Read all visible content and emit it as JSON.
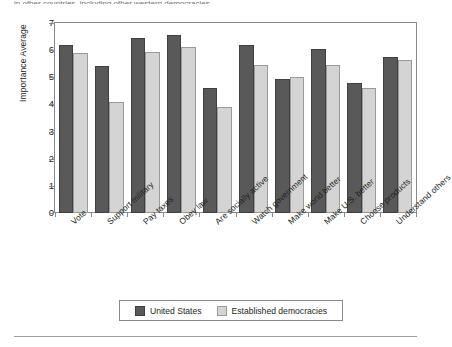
{
  "caption": {
    "clipped_text": "in other countries, including other western democracies."
  },
  "chart_data": {
    "type": "bar",
    "title": "",
    "xlabel": "",
    "ylabel": "Importance Average",
    "ylim": [
      0,
      7
    ],
    "yticks": [
      0,
      1,
      2,
      3,
      4,
      5,
      6,
      7
    ],
    "grid": false,
    "legend_position": "bottom",
    "categories": [
      "Vote",
      "Support military",
      "Pay taxes",
      "Obey law",
      "Are socially active",
      "Watch government",
      "Make world better",
      "Make U.S. better",
      "Choose products",
      "Understand others"
    ],
    "series": [
      {
        "name": "United States",
        "color": "#595959",
        "values": [
          6.2,
          5.4,
          6.45,
          6.55,
          4.6,
          6.2,
          4.95,
          6.05,
          4.8,
          5.75
        ]
      },
      {
        "name": "Established democracies",
        "color": "#d4d4d4",
        "values": [
          5.9,
          4.1,
          5.95,
          6.1,
          3.9,
          5.45,
          5.0,
          5.45,
          4.6,
          5.65
        ]
      }
    ]
  },
  "legend": {
    "items": [
      {
        "label": "United States",
        "color": "#595959"
      },
      {
        "label": "Established democracies",
        "color": "#d4d4d4"
      }
    ]
  }
}
